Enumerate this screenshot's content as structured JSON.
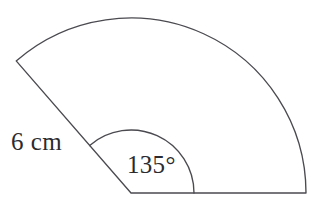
{
  "figure": {
    "kind": "circular-sector",
    "background_color": "#ffffff",
    "stroke_color": "#4a4a50",
    "text_color": "#2b2b2f",
    "labels": {
      "radius": "6 cm",
      "angle": "135°"
    },
    "geometry": {
      "center_x": 131,
      "center_y": 193,
      "outer_radius": 175,
      "inner_arc_radius": 63,
      "start_angle_deg": 0,
      "end_angle_deg": 131,
      "baseline_end_x": 306,
      "baseline_end_y": 193,
      "slant_end_x": 18,
      "slant_end_y": 62
    }
  },
  "chart_data": {
    "type": "diagram",
    "title": "",
    "shape": "circular sector (pie slice)",
    "annotations": [
      {
        "name": "radius-label",
        "text": "6 cm",
        "describes": "length of the sector radius"
      },
      {
        "name": "angle-label",
        "text": "135°",
        "describes": "central angle of the sector"
      }
    ],
    "values": {
      "radius_cm": 6,
      "central_angle_deg": 135
    },
    "xlabel": "",
    "ylabel": "",
    "legend": []
  }
}
